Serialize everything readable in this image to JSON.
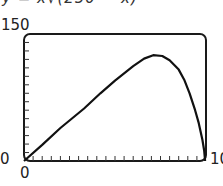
{
  "chart_data": {
    "type": "line",
    "title": "y = x√(250 − x)",
    "xlabel": "",
    "ylabel": "",
    "xlim": [
      0,
      100
    ],
    "ylim": [
      0,
      150
    ],
    "x_tick_labels": [
      "0",
      "100"
    ],
    "y_tick_labels": [
      "0",
      "150"
    ],
    "x_minor_tick_step": 5,
    "y_minor_tick_step": 10,
    "grid": false,
    "legend": null,
    "series": [
      {
        "name": "curve",
        "x": [
          0,
          10,
          20,
          33,
          42,
          50,
          60,
          66,
          71,
          76,
          80,
          85,
          88,
          91,
          94,
          96,
          98,
          99,
          99.5
        ],
        "y": [
          0,
          19,
          39,
          62,
          80,
          95,
          112,
          121,
          125,
          124,
          119,
          108,
          96,
          80,
          60,
          45,
          25,
          12,
          0
        ]
      }
    ]
  }
}
